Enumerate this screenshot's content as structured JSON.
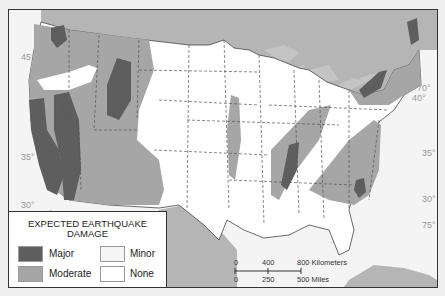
{
  "map": {
    "type": "thematic choropleth map",
    "region": "Contiguous United States",
    "colors": {
      "major": "#5e5e5e",
      "moderate": "#a6a6a6",
      "minor": "#f5f5f5",
      "none": "#ffffff",
      "foreign_land": "#b5b5b5",
      "water": "#f2f2f2",
      "lakes": "#c4c4c4"
    },
    "latitude_labels": [
      "45°",
      "40°",
      "35°",
      "30°"
    ],
    "latitude_labels_east": [
      "40°",
      "35°",
      "30°"
    ],
    "longitude_labels": [
      "70°",
      "75°"
    ]
  },
  "legend": {
    "title_line1": "EXPECTED EARTHQUAKE",
    "title_line2": "DAMAGE",
    "items": [
      {
        "label": "Major",
        "color": "#5e5e5e"
      },
      {
        "label": "Moderate",
        "color": "#a6a6a6"
      },
      {
        "label": "Minor",
        "color": "#f5f5f5"
      },
      {
        "label": "None",
        "color": "#ffffff"
      }
    ]
  },
  "scale_bar": {
    "km_labels": [
      "0",
      "400",
      "800 Kilometers"
    ],
    "mile_labels": [
      "0",
      "250",
      "500 Miles"
    ]
  }
}
